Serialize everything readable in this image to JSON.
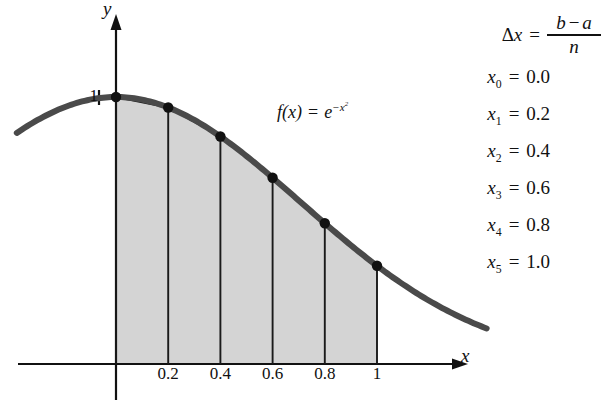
{
  "figure": {
    "axis": {
      "x_label": "x",
      "y_label": "y",
      "y_tick_label": "1"
    },
    "function_label": {
      "fx": "f(x)",
      "equals": "=",
      "base": "e",
      "exponent": "−x",
      "exponent_power": "2"
    },
    "colors": {
      "curve": "#4a4a4a",
      "fill": "#d4d4d4",
      "axis": "#111111",
      "divider": "#1a1a1a",
      "dot": "#111111",
      "background": "#ffffff"
    }
  },
  "formula": {
    "delta_lhs_delta": "Δ",
    "delta_lhs_var": "x",
    "equals": "=",
    "numerator_b": "b",
    "numerator_minus": "−",
    "numerator_a": "a",
    "denominator": "n"
  },
  "x_values": [
    {
      "var": "x",
      "index": "0",
      "equals": "=",
      "value": "0.0"
    },
    {
      "var": "x",
      "index": "1",
      "equals": "=",
      "value": "0.2"
    },
    {
      "var": "x",
      "index": "2",
      "equals": "=",
      "value": "0.4"
    },
    {
      "var": "x",
      "index": "3",
      "equals": "=",
      "value": "0.6"
    },
    {
      "var": "x",
      "index": "4",
      "equals": "=",
      "value": "0.8"
    },
    {
      "var": "x",
      "index": "5",
      "equals": "=",
      "value": "1.0"
    }
  ],
  "chart_data": {
    "type": "area",
    "title": "",
    "subtitle": "",
    "xlabel": "x",
    "ylabel": "y",
    "xlim": [
      -0.38,
      1.5
    ],
    "ylim": [
      0,
      1.18
    ],
    "grid": false,
    "legend": null,
    "function_expression": "f(x) = e^(-x^2)",
    "method": "trapezoidal rule",
    "interval": [
      0.0,
      1.0
    ],
    "n_subintervals": 5,
    "delta_x": 0.2,
    "x_tick_labels": [
      "0.2",
      "0.4",
      "0.6",
      "0.8",
      "1"
    ],
    "x_ticks": [
      0.2,
      0.4,
      0.6,
      0.8,
      1.0
    ],
    "y_tick_labels": [
      "1"
    ],
    "y_ticks": [
      1.0
    ],
    "nodes": [
      {
        "label": "x0",
        "x": 0.0,
        "y": 1.0
      },
      {
        "label": "x1",
        "x": 0.2,
        "y": 0.9608
      },
      {
        "label": "x2",
        "x": 0.4,
        "y": 0.8521
      },
      {
        "label": "x3",
        "x": 0.6,
        "y": 0.6977
      },
      {
        "label": "x4",
        "x": 0.8,
        "y": 0.5273
      },
      {
        "label": "x5",
        "x": 1.0,
        "y": 0.3679
      }
    ],
    "curve_domain": [
      -0.38,
      1.42
    ],
    "shaded_region": {
      "from": 0.0,
      "to": 1.0,
      "fill": "#d4d4d4",
      "description": "five trapezoids under the curve"
    }
  }
}
